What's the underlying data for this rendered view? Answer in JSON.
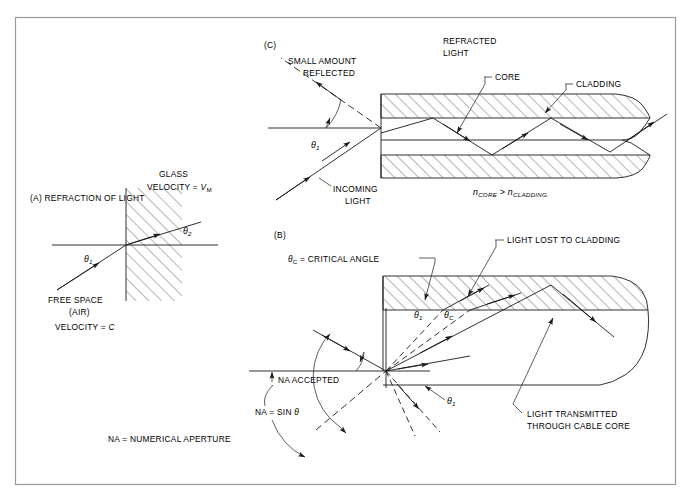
{
  "figure": {
    "background_color": "#ffffff",
    "line_color": "#1a1a1a",
    "border_color": "#9a9a9a"
  },
  "panel_a": {
    "key": "(A) REFRACTION OF LIGHT",
    "glass_label": "GLASS",
    "glass_velocity": "VELOCITY = ",
    "glass_velocity_symbol": "V",
    "glass_velocity_subscript": "M",
    "free_space_line1": "FREE SPACE",
    "free_space_line2": "(AIR)",
    "free_space_velocity": "VELOCITY = ",
    "free_space_velocity_symbol": "C",
    "theta_1": "θ",
    "theta_1_sub": "1",
    "theta_2": "θ",
    "theta_2_sub": "2"
  },
  "panel_c": {
    "key": "(C)",
    "small_amount_line1": "SMALL AMOUNT",
    "small_amount_line2": "REFLECTED",
    "refracted_line1": "REFRACTED",
    "refracted_line2": "LIGHT",
    "incoming_line1": "INCOMING",
    "incoming_line2": "LIGHT",
    "core_label": "CORE",
    "cladding_label": "CLADDING",
    "theta_1": "θ",
    "theta_1_sub": "1",
    "index_relation_n1": "n",
    "index_relation_sub1": "CORE",
    "index_relation_op": " > ",
    "index_relation_n2": "n",
    "index_relation_sub2": "CLADDING."
  },
  "panel_b": {
    "key": "(B)",
    "critical_angle_symbol": "θ",
    "critical_angle_sub": "C",
    "critical_angle_text": " = CRITICAL ANGLE",
    "light_lost": "LIGHT LOST TO CLADDING",
    "light_transmitted_line1": "LIGHT TRANSMITTED",
    "light_transmitted_line2": "THROUGH CABLE CORE",
    "na_accepted": "NA ACCEPTED",
    "na_formula_prefix": "NA = SIN ",
    "na_formula_symbol": "θ",
    "na_definition": "NA = NUMERICAL APERTURE",
    "theta_1": "θ",
    "theta_1_sub": "1",
    "theta_c": "θ",
    "theta_c_sub": "C"
  }
}
